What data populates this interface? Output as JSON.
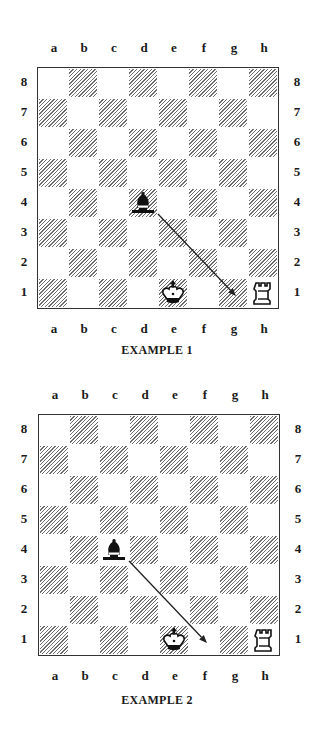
{
  "files": [
    "a",
    "b",
    "c",
    "d",
    "e",
    "f",
    "g",
    "h"
  ],
  "ranks": [
    "8",
    "7",
    "6",
    "5",
    "4",
    "3",
    "2",
    "1"
  ],
  "colors": {
    "hatch": "#6e6e6e",
    "border": "#333333",
    "ink": "#1a1a1a",
    "background": "#ffffff"
  },
  "examples": [
    {
      "caption": "EXAMPLE 1",
      "pieces": [
        {
          "type": "bishop",
          "color": "black",
          "square": "d4"
        },
        {
          "type": "king",
          "color": "white",
          "square": "e1"
        },
        {
          "type": "rook",
          "color": "white",
          "square": "h1"
        }
      ],
      "arrow": {
        "from": "d4",
        "to": "g1"
      }
    },
    {
      "caption": "EXAMPLE 2",
      "pieces": [
        {
          "type": "bishop",
          "color": "black",
          "square": "c4"
        },
        {
          "type": "king",
          "color": "white",
          "square": "e1"
        },
        {
          "type": "rook",
          "color": "white",
          "square": "h1"
        }
      ],
      "arrow": {
        "from": "c4",
        "to": "f1"
      }
    }
  ]
}
